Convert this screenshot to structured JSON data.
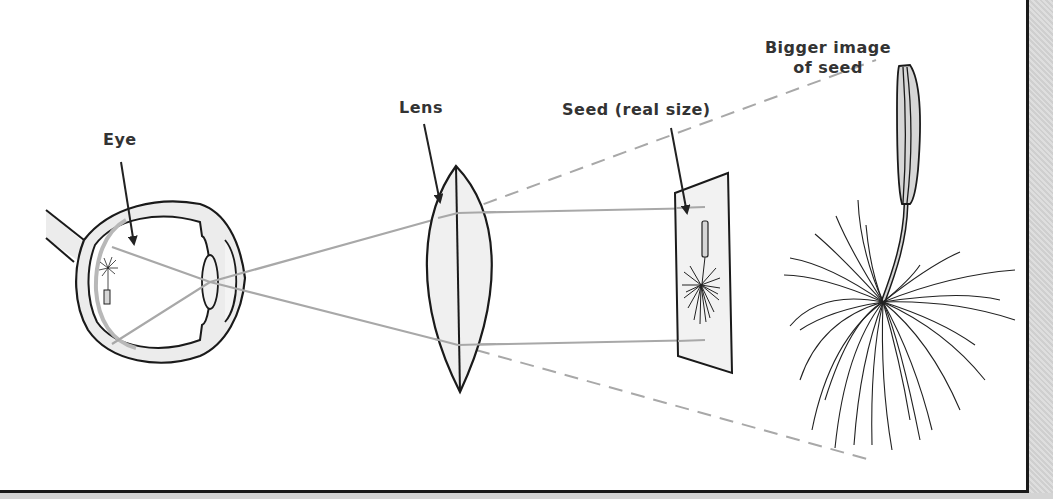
{
  "diagram": {
    "labels": {
      "eye": "Eye",
      "lens": "Lens",
      "seed": "Seed (real size)",
      "bigger_image_line1": "Bigger image",
      "bigger_image_line2": "of seed"
    },
    "colors": {
      "outline": "#1a1a1a",
      "fill_light": "#efefef",
      "fill_mid": "#d6d6d6",
      "ray": "#a8a8a8",
      "text": "#333333",
      "background": "#ffffff"
    },
    "components": [
      {
        "id": "eye",
        "label": "Eye"
      },
      {
        "id": "lens",
        "label": "Lens"
      },
      {
        "id": "seed-real",
        "label": "Seed (real size)"
      },
      {
        "id": "seed-image",
        "label": "Bigger image of seed"
      }
    ]
  }
}
